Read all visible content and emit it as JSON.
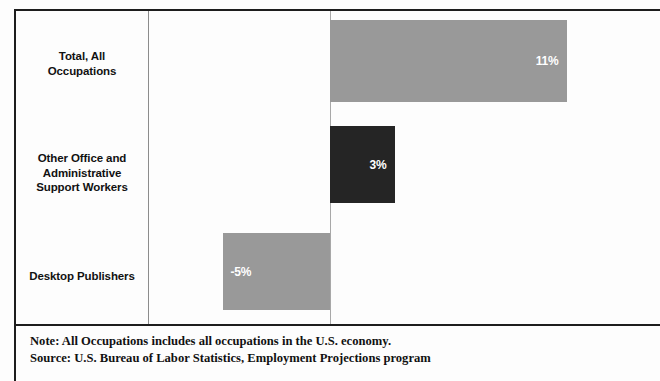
{
  "chart_data": {
    "type": "bar",
    "orientation": "horizontal",
    "title": "",
    "subtitle": "",
    "xlabel": "",
    "ylabel": "",
    "grid": false,
    "legend": "none",
    "zero_line": true,
    "xlim": [
      -7,
      14
    ],
    "categories": [
      "Total, All\nOccupations",
      "Other Office and\nAdministrative\nSupport Workers",
      "Desktop Publishers"
    ],
    "values": [
      11,
      3,
      -5
    ],
    "value_labels": [
      "11%",
      "3%",
      "-5%"
    ],
    "bar_colors": [
      "#999999",
      "#252525",
      "#999999"
    ],
    "notes": [
      "Note: All Occupations includes all occupations in the U.S. economy.",
      "Source: U.S. Bureau of Labor Statistics, Employment Projections program"
    ]
  },
  "categories": [
    {
      "line1": "Total, All",
      "line2": "Occupations",
      "line3": ""
    },
    {
      "line1": "Other Office and",
      "line2": "Administrative",
      "line3": "Support Workers"
    },
    {
      "line1": "Desktop Publishers",
      "line2": "",
      "line3": ""
    }
  ],
  "bars": [
    {
      "value_label": "11%"
    },
    {
      "value_label": "3%"
    },
    {
      "value_label": "-5%"
    }
  ],
  "footnotes": {
    "note": "Note: All Occupations includes all occupations in the U.S. economy.",
    "source": "Source: U.S. Bureau of Labor Statistics, Employment Projections program"
  }
}
